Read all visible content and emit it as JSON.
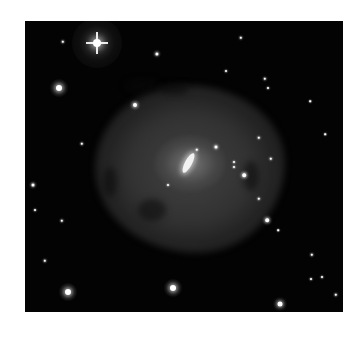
{
  "image": {
    "subject": "spiral galaxy with bright elongated core and faint diffuse disk in a star field",
    "background_color": "#030303",
    "frame": {
      "x": 25,
      "y": 21,
      "width": 318,
      "height": 291
    }
  },
  "galaxy": {
    "core": {
      "x": 163,
      "y": 142,
      "angle_deg": 28
    }
  },
  "stars": [
    {
      "x": 72,
      "y": 22,
      "r": 4,
      "spikes": true
    },
    {
      "x": 34,
      "y": 67,
      "r": 3
    },
    {
      "x": 110,
      "y": 84,
      "r": 2
    },
    {
      "x": 132,
      "y": 33,
      "r": 1.6
    },
    {
      "x": 38,
      "y": 21,
      "r": 1.2
    },
    {
      "x": 216,
      "y": 17,
      "r": 1.2
    },
    {
      "x": 240,
      "y": 58,
      "r": 1.2
    },
    {
      "x": 243,
      "y": 67,
      "r": 1
    },
    {
      "x": 8,
      "y": 164,
      "r": 1.5
    },
    {
      "x": 10,
      "y": 189,
      "r": 1
    },
    {
      "x": 37,
      "y": 200,
      "r": 1.2
    },
    {
      "x": 20,
      "y": 240,
      "r": 1.2
    },
    {
      "x": 43,
      "y": 271,
      "r": 3
    },
    {
      "x": 148,
      "y": 267,
      "r": 3
    },
    {
      "x": 255,
      "y": 283,
      "r": 2.5
    },
    {
      "x": 311,
      "y": 274,
      "r": 1.2
    },
    {
      "x": 287,
      "y": 234,
      "r": 1.2
    },
    {
      "x": 297,
      "y": 256,
      "r": 1
    },
    {
      "x": 286,
      "y": 258,
      "r": 1
    },
    {
      "x": 242,
      "y": 199,
      "r": 1.8
    },
    {
      "x": 234,
      "y": 178,
      "r": 1.2
    },
    {
      "x": 219,
      "y": 154,
      "r": 1.8
    },
    {
      "x": 209,
      "y": 141,
      "r": 1
    },
    {
      "x": 209,
      "y": 146,
      "r": 1
    },
    {
      "x": 191,
      "y": 126,
      "r": 1.5
    },
    {
      "x": 172,
      "y": 129,
      "r": 1.2
    },
    {
      "x": 234,
      "y": 117,
      "r": 1.2
    },
    {
      "x": 246,
      "y": 138,
      "r": 1.2
    },
    {
      "x": 143,
      "y": 164,
      "r": 1
    },
    {
      "x": 57,
      "y": 123,
      "r": 1.2
    },
    {
      "x": 201,
      "y": 50,
      "r": 1
    },
    {
      "x": 285,
      "y": 80,
      "r": 0.8
    },
    {
      "x": 300,
      "y": 113,
      "r": 0.8
    },
    {
      "x": 253,
      "y": 209,
      "r": 0.8
    }
  ]
}
